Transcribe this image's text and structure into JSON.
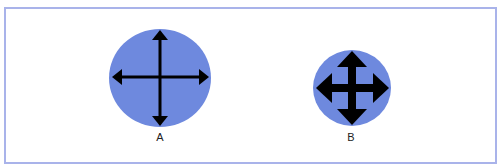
{
  "colors": {
    "frame_border": "#a9b3ea",
    "circle_fill": "#6e89de",
    "arrow": "#000000"
  },
  "figures": [
    {
      "id": "A",
      "label": "A",
      "icon": "move-cursor-thin-arrows-icon"
    },
    {
      "id": "B",
      "label": "B",
      "icon": "move-cursor-bold-arrows-icon"
    }
  ]
}
